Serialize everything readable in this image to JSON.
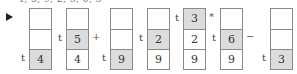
{
  "top_line": "4, 5, 9, 2, 3, 6, 3",
  "marker": "▶",
  "tag_label": "t",
  "columns": [
    {
      "left": 29,
      "cells": [
        "",
        "",
        "4"
      ],
      "highlight": 2,
      "tag_row": 2,
      "op": ""
    },
    {
      "left": 66,
      "cells": [
        "",
        "5",
        "4"
      ],
      "highlight": 1,
      "tag_row": 1,
      "op": "+"
    },
    {
      "left": 110,
      "cells": [
        "",
        "",
        "9"
      ],
      "highlight": 2,
      "tag_row": 2,
      "op": ""
    },
    {
      "left": 147,
      "cells": [
        "",
        "2",
        "9"
      ],
      "highlight": 1,
      "tag_row": 1,
      "op": ""
    },
    {
      "left": 183,
      "cells": [
        "3",
        "2",
        "9"
      ],
      "highlight": 0,
      "tag_row": 0,
      "op": "*"
    },
    {
      "left": 220,
      "cells": [
        "",
        "6",
        "9"
      ],
      "highlight": 1,
      "tag_row": 1,
      "op": "−"
    },
    {
      "left": 270,
      "cells": [
        "",
        "",
        "3"
      ],
      "highlight": 2,
      "tag_row": 2,
      "op": ""
    }
  ],
  "colors": {
    "highlight": "#dcdcdc",
    "border": "#8a8a8a"
  }
}
